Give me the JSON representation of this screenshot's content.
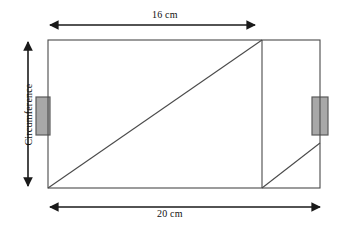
{
  "figure": {
    "kind": "cylinder-net-diagram",
    "background_color": "#ffffff",
    "line_color": "#3f3f3f",
    "arrow_color": "#1a1a1a",
    "tab_fill_color": "#a8a8a8",
    "tab_stroke_color": "#5a5a5a",
    "labels": {
      "top_dimension": "16 cm",
      "bottom_dimension": "20 cm",
      "left_dimension": "Circumference"
    },
    "geometry": {
      "rect_left": 48,
      "rect_top": 40,
      "rect_right": 320,
      "rect_bottom": 188,
      "inner_vertical_x": 262,
      "main_diagonal": [
        48,
        188,
        262,
        40
      ],
      "small_diagonal": [
        262,
        188,
        320,
        143
      ],
      "top_arrow": [
        48,
        25,
        257,
        25
      ],
      "bottom_arrow": [
        48,
        207,
        322,
        207
      ],
      "left_arrow": [
        28,
        40,
        28,
        188
      ],
      "left_tab": [
        36,
        97,
        14,
        38
      ],
      "right_tab": [
        312,
        97,
        16,
        38
      ]
    }
  }
}
